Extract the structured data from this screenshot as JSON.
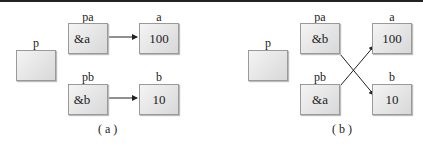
{
  "panels": {
    "a": {
      "caption": "( a )",
      "p": "p",
      "pa": {
        "label": "pa",
        "value": "&a"
      },
      "pb": {
        "label": "pb",
        "value": "&b"
      },
      "a": {
        "label": "a",
        "value": "100"
      },
      "b": {
        "label": "b",
        "value": "10"
      }
    },
    "b": {
      "caption": "( b )",
      "p": "p",
      "pa": {
        "label": "pa",
        "value": "&b"
      },
      "pb": {
        "label": "pb",
        "value": "&a"
      },
      "a": {
        "label": "a",
        "value": "100"
      },
      "b": {
        "label": "b",
        "value": "10"
      }
    }
  }
}
